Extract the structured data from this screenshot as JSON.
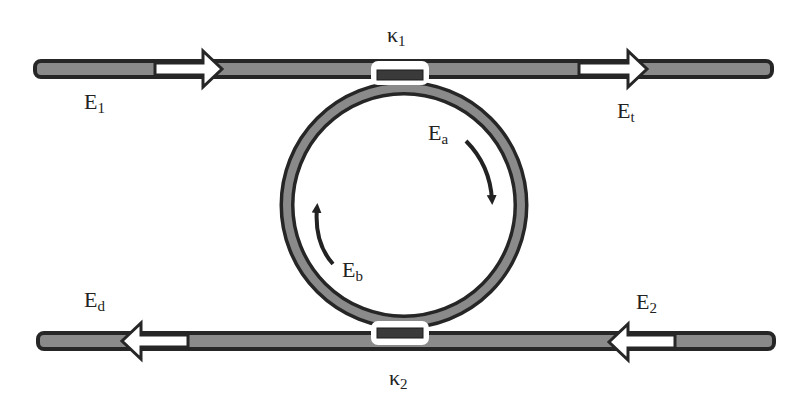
{
  "diagram": {
    "colors": {
      "waveguide_fill": "#8a8a8a",
      "waveguide_border": "#262626",
      "arrow_fill": "#ffffff",
      "background": "#ffffff"
    },
    "labels": {
      "input": {
        "main": "E",
        "sub": "1"
      },
      "through": {
        "main": "E",
        "sub": "t"
      },
      "add": {
        "main": "E",
        "sub": "2"
      },
      "drop": {
        "main": "E",
        "sub": "d"
      },
      "ring_cw": {
        "main": "E",
        "sub": "a"
      },
      "ring_ccw": {
        "main": "E",
        "sub": "b"
      },
      "coupler_top": {
        "main": "κ",
        "sub": "1"
      },
      "coupler_bottom": {
        "main": "κ",
        "sub": "2"
      }
    }
  }
}
